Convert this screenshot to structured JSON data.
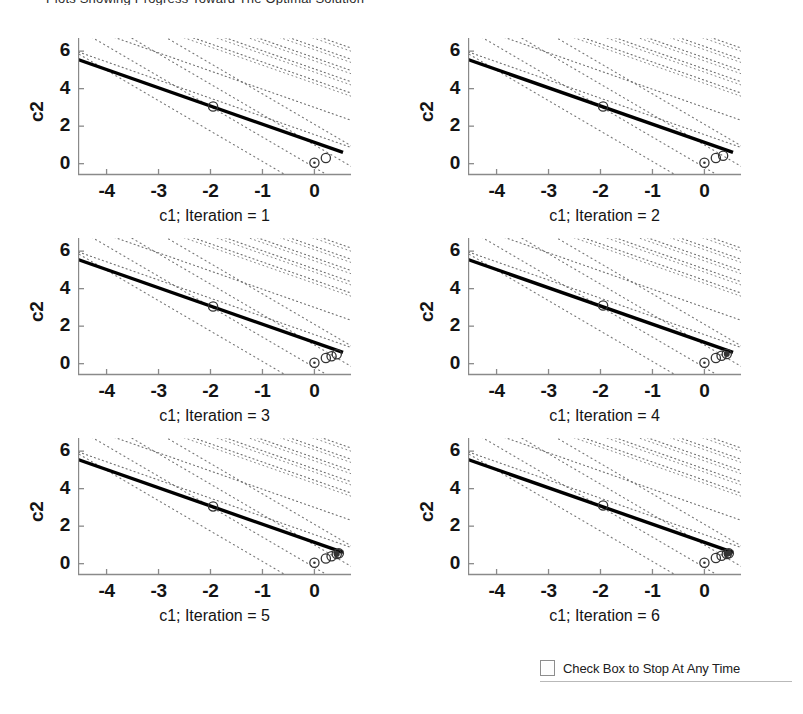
{
  "top_clipped_text": "Plots Showing Progress Toward The Optimal Solution",
  "figure": {
    "background": "#ffffff",
    "line_color": "#000000",
    "contour_color": "#555555",
    "axis_color": "#8a8a8a",
    "marker_color": "#333333"
  },
  "control": {
    "checkbox_label": "Check Box to Stop At Any Time",
    "checked": false
  },
  "chart_data": {
    "type": "line",
    "title": "",
    "xlabel": "c1",
    "ylabel": "c2",
    "xlim": [
      -4.55,
      0.55
    ],
    "ylim": [
      -0.55,
      6.7
    ],
    "xticks": [
      -4,
      -3,
      -2,
      -1,
      0
    ],
    "xticklabels": [
      "-4",
      "-3",
      "-2",
      "-1",
      "0"
    ],
    "yticks": [
      0,
      2,
      4,
      6
    ],
    "yticklabels": [
      "0",
      "2",
      "4",
      "6"
    ],
    "grid": false,
    "legend": null,
    "n_subplots": 6,
    "subplot_grid": [
      3,
      2
    ],
    "shared_series": {
      "name": "constraint-line",
      "comment": "solid heavy line through the feasible boundary",
      "x": [
        -4.55,
        0.55
      ],
      "y": [
        5.55,
        0.6
      ]
    },
    "contours": {
      "comment": "dotted objective-contour families, parallel dotted lines",
      "family_a_slope": -0.97,
      "family_a_intercepts": [
        6.85,
        6.25,
        5.65,
        5.05,
        4.45,
        3.0,
        1.55
      ],
      "family_b_slope": -1.62,
      "family_b_intercepts": [
        2.1,
        1.0,
        -0.2,
        -1.5
      ],
      "style": "dotted"
    },
    "subplots": [
      {
        "index": 1,
        "xlabel": "c1; Iteration = 1",
        "ylabel": "c2",
        "markers": [
          {
            "x": -1.95,
            "y": 3.05,
            "type": "circle"
          },
          {
            "x": 0.0,
            "y": 0.05,
            "type": "circle-dot"
          },
          {
            "x": 0.22,
            "y": 0.3,
            "type": "circle"
          }
        ]
      },
      {
        "index": 2,
        "xlabel": "c1; Iteration = 2",
        "ylabel": "c2",
        "markers": [
          {
            "x": -1.95,
            "y": 3.05,
            "type": "circle"
          },
          {
            "x": 0.0,
            "y": 0.05,
            "type": "circle-dot"
          },
          {
            "x": 0.22,
            "y": 0.3,
            "type": "circle"
          },
          {
            "x": 0.36,
            "y": 0.42,
            "type": "circle"
          }
        ]
      },
      {
        "index": 3,
        "xlabel": "c1; Iteration = 3",
        "ylabel": "c2",
        "markers": [
          {
            "x": -1.95,
            "y": 3.05,
            "type": "circle"
          },
          {
            "x": 0.0,
            "y": 0.05,
            "type": "circle-dot"
          },
          {
            "x": 0.22,
            "y": 0.3,
            "type": "circle"
          },
          {
            "x": 0.33,
            "y": 0.4,
            "type": "circle"
          },
          {
            "x": 0.43,
            "y": 0.5,
            "type": "circle"
          }
        ]
      },
      {
        "index": 4,
        "xlabel": "c1; Iteration = 4",
        "ylabel": "c2",
        "markers": [
          {
            "x": -1.95,
            "y": 3.1,
            "type": "circle"
          },
          {
            "x": 0.0,
            "y": 0.05,
            "type": "circle-dot"
          },
          {
            "x": 0.22,
            "y": 0.3,
            "type": "circle"
          },
          {
            "x": 0.33,
            "y": 0.42,
            "type": "circle"
          },
          {
            "x": 0.43,
            "y": 0.52,
            "type": "circle-filled"
          }
        ]
      },
      {
        "index": 5,
        "xlabel": "c1; Iteration = 5",
        "ylabel": "c2",
        "markers": [
          {
            "x": -1.95,
            "y": 3.05,
            "type": "circle"
          },
          {
            "x": 0.0,
            "y": 0.05,
            "type": "circle-dot"
          },
          {
            "x": 0.22,
            "y": 0.28,
            "type": "circle"
          },
          {
            "x": 0.33,
            "y": 0.4,
            "type": "circle"
          },
          {
            "x": 0.43,
            "y": 0.52,
            "type": "circle-filled"
          },
          {
            "x": 0.47,
            "y": 0.55,
            "type": "circle"
          }
        ]
      },
      {
        "index": 6,
        "xlabel": "c1; Iteration = 6",
        "ylabel": "c2",
        "markers": [
          {
            "x": -1.95,
            "y": 3.1,
            "type": "circle"
          },
          {
            "x": 0.0,
            "y": 0.05,
            "type": "circle-dot"
          },
          {
            "x": 0.22,
            "y": 0.3,
            "type": "circle"
          },
          {
            "x": 0.33,
            "y": 0.42,
            "type": "circle"
          },
          {
            "x": 0.43,
            "y": 0.52,
            "type": "circle-filled"
          },
          {
            "x": 0.47,
            "y": 0.55,
            "type": "circle-filled"
          }
        ]
      }
    ]
  }
}
